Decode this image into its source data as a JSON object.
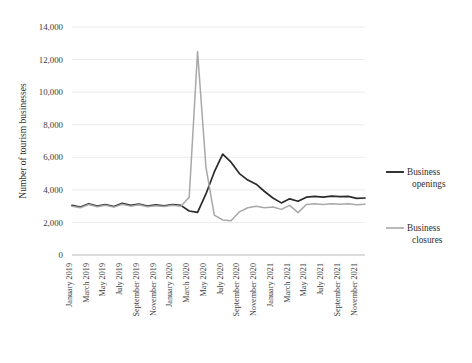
{
  "chart_data": {
    "type": "line",
    "title": "",
    "xlabel": "",
    "ylabel": "Number of tourism businesses",
    "ylim": [
      0,
      14000
    ],
    "ytick_step": 2000,
    "yticks": [
      0,
      2000,
      4000,
      6000,
      8000,
      10000,
      12000,
      14000
    ],
    "ytick_labels": [
      "0",
      "2,000",
      "4,000",
      "6,000",
      "8,000",
      "10,000",
      "12,000",
      "14,000"
    ],
    "grid": true,
    "legend_position": "right",
    "x": [
      "January 2019",
      "February 2019",
      "March 2019",
      "April 2019",
      "May 2019",
      "June 2019",
      "July 2019",
      "August 2019",
      "September 2019",
      "October 2019",
      "November 2019",
      "December 2019",
      "January 2020",
      "February 2020",
      "March 2020",
      "April 2020",
      "May 2020",
      "June 2020",
      "July 2020",
      "August 2020",
      "September 2020",
      "October 2020",
      "November 2020",
      "December 2020",
      "January 2021",
      "February 2021",
      "March 2021",
      "April 2021",
      "May 2021",
      "June 2021",
      "July 2021",
      "August 2021",
      "September 2021",
      "October 2021",
      "November 2021",
      "December 2021"
    ],
    "xtick_labels": [
      "January 2019",
      "March 2019",
      "May 2019",
      "July 2019",
      "September 2019",
      "November 2019",
      "January 2020",
      "March 2020",
      "May 2020",
      "July 2020",
      "September 2020",
      "November 2020",
      "January 2021",
      "March 2021",
      "May 2021",
      "July 2021",
      "September 2021",
      "November 2021"
    ],
    "xtick_indices": [
      0,
      2,
      4,
      6,
      8,
      10,
      12,
      14,
      16,
      18,
      20,
      22,
      24,
      26,
      28,
      30,
      32,
      34
    ],
    "series": [
      {
        "name": "Business openings",
        "color": "#2b2b2b",
        "width": 1.7,
        "values": [
          3050,
          2950,
          3150,
          3000,
          3100,
          2980,
          3180,
          3050,
          3120,
          3000,
          3080,
          3020,
          3100,
          3050,
          2700,
          2620,
          3750,
          5100,
          6200,
          5700,
          5000,
          4600,
          4350,
          3900,
          3500,
          3200,
          3450,
          3300,
          3550,
          3600,
          3550,
          3620,
          3580,
          3600,
          3480,
          3500
        ]
      },
      {
        "name": "Business closures",
        "color": "#a8a8a8",
        "width": 1.5,
        "values": [
          3000,
          2900,
          3100,
          2960,
          3050,
          2940,
          3120,
          3000,
          3080,
          2960,
          3030,
          2980,
          3050,
          3000,
          3550,
          12500,
          5400,
          2450,
          2150,
          2100,
          2650,
          2900,
          3000,
          2900,
          2950,
          2800,
          3050,
          2600,
          3100,
          3150,
          3100,
          3150,
          3120,
          3150,
          3080,
          3120
        ]
      }
    ],
    "annotations": []
  },
  "legend": {
    "items": [
      {
        "label_line1": "Business",
        "label_line2": "openings",
        "color": "#2b2b2b"
      },
      {
        "label_line1": "Business",
        "label_line2": "closures",
        "color": "#a8a8a8"
      }
    ]
  }
}
